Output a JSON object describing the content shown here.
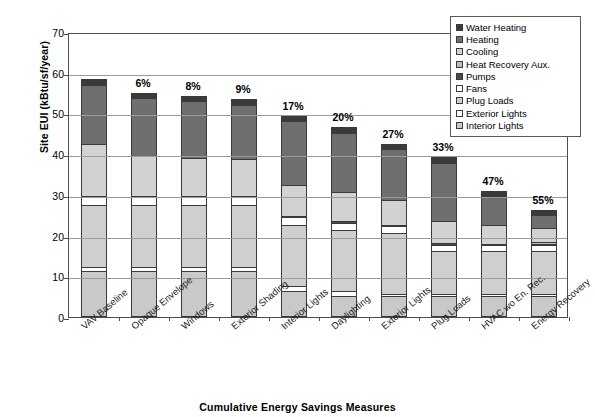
{
  "chart_data": {
    "type": "bar",
    "subtype": "stacked-bar",
    "title": "",
    "xlabel": "Cumulative Energy Savings Measures",
    "ylabel": "Site EUI (kBtu/sf/year)",
    "ylim": [
      0,
      70
    ],
    "ytick_step": 10,
    "ytick_labels": [
      "0",
      "10",
      "20",
      "30",
      "40",
      "50",
      "60",
      "70"
    ],
    "grid": "horizontal",
    "legend_position": "top-right",
    "categories": [
      "VAV Baseline",
      "Opaque Envelope",
      "Windows",
      "Exterior Shading",
      "Interior Lights",
      "Daylighting",
      "Exterior Lights",
      "Plug Loads",
      "HVAC wo En. Rec.",
      "Energy Recovery"
    ],
    "series": [
      {
        "name": "Interior Lights",
        "swatch": "#c9c9c9",
        "values": [
          11.2,
          11.2,
          11.2,
          11.2,
          6.4,
          5.2,
          5.2,
          5.2,
          5.2,
          5.2
        ]
      },
      {
        "name": "Exterior Lights",
        "swatch": "#ffffff",
        "values": [
          1.2,
          1.2,
          1.2,
          1.2,
          1.2,
          1.2,
          0.4,
          0.4,
          0.4,
          0.4
        ]
      },
      {
        "name": "Plug Loads",
        "swatch": "#cfcfcf",
        "values": [
          15.1,
          15.1,
          15.1,
          15.1,
          15.1,
          15.1,
          15.1,
          10.7,
          10.7,
          10.7
        ]
      },
      {
        "name": "Fans",
        "swatch": "#ffffff",
        "values": [
          2.0,
          2.0,
          2.0,
          2.0,
          1.8,
          1.7,
          1.6,
          1.5,
          1.3,
          1.3
        ]
      },
      {
        "name": "Pumps",
        "swatch": "#4a4a4a",
        "values": [
          0.3,
          0.3,
          0.3,
          0.3,
          0.3,
          0.3,
          0.3,
          0.3,
          0.3,
          0.3
        ]
      },
      {
        "name": "Heat Recovery Aux.",
        "swatch": "#bdbdbd",
        "values": [
          0.0,
          0.0,
          0.0,
          0.0,
          0.0,
          0.0,
          0.0,
          0.0,
          0.0,
          0.6
        ]
      },
      {
        "name": "Cooling",
        "swatch": "#d2d2d2",
        "values": [
          12.6,
          9.8,
          9.3,
          8.9,
          7.7,
          7.2,
          6.1,
          5.6,
          4.6,
          3.4
        ]
      },
      {
        "name": "Heating",
        "swatch": "#6f6f6f",
        "values": [
          14.7,
          14.1,
          13.9,
          13.5,
          15.6,
          14.6,
          12.6,
          14.2,
          7.2,
          3.2
        ]
      },
      {
        "name": "Water Heating",
        "swatch": "#3a3a3a",
        "values": [
          1.3,
          1.3,
          1.3,
          1.3,
          1.3,
          1.3,
          1.3,
          1.3,
          1.3,
          1.3
        ]
      }
    ],
    "totals": [
      58.4,
      55.0,
      54.3,
      53.5,
      49.4,
      46.6,
      42.6,
      39.2,
      31.0,
      26.4
    ],
    "savings_labels": [
      "",
      "6%",
      "8%",
      "9%",
      "17%",
      "20%",
      "27%",
      "33%",
      "47%",
      "55%"
    ]
  },
  "legend": {
    "entries": [
      {
        "label": "Water Heating"
      },
      {
        "label": "Heating"
      },
      {
        "label": "Cooling"
      },
      {
        "label": "Heat Recovery Aux."
      },
      {
        "label": "Pumps"
      },
      {
        "label": "Fans"
      },
      {
        "label": "Plug Loads"
      },
      {
        "label": "Exterior Lights"
      },
      {
        "label": "Interior Lights"
      }
    ]
  }
}
